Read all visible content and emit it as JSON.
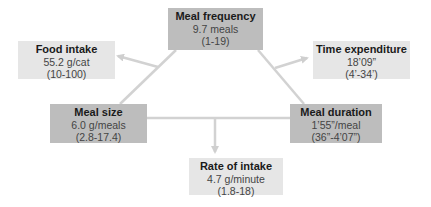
{
  "colors": {
    "primary_box": "#bdbdbd",
    "secondary_box": "#e6e6e6",
    "connector": "#cfcfcf",
    "title_text": "#1a1a1a",
    "value_text": "#444444"
  },
  "nodes": {
    "meal_frequency": {
      "title": "Meal frequency",
      "value": "9.7 meals",
      "range": "(1-19)"
    },
    "food_intake": {
      "title": "Food intake",
      "value": "55.2 g/cat",
      "range": "(10-100)"
    },
    "time_expenditure": {
      "title": "Time expenditure",
      "value": "18’09”",
      "range": "(4’-34’)"
    },
    "meal_size": {
      "title": "Meal size",
      "value": "6.0 g/meals",
      "range": "(2.8-17.4)"
    },
    "meal_duration": {
      "title": "Meal duration",
      "value": "1’55”/meal",
      "range": "(36”-4’07”)"
    },
    "rate_of_intake": {
      "title": "Rate of intake",
      "value": "4.7 g/minute",
      "range": "(1.8-18)"
    }
  },
  "edges": [
    {
      "from": "meal_frequency",
      "to": "meal_size",
      "type": "line"
    },
    {
      "from": "meal_frequency",
      "to": "meal_duration",
      "type": "line"
    },
    {
      "from": "meal_size",
      "to": "meal_duration",
      "type": "line"
    },
    {
      "from": "meal_frequency-meal_size",
      "to": "food_intake",
      "type": "arrow"
    },
    {
      "from": "meal_frequency-meal_duration",
      "to": "time_expenditure",
      "type": "arrow"
    },
    {
      "from": "meal_size-meal_duration",
      "to": "rate_of_intake",
      "type": "arrow"
    }
  ]
}
